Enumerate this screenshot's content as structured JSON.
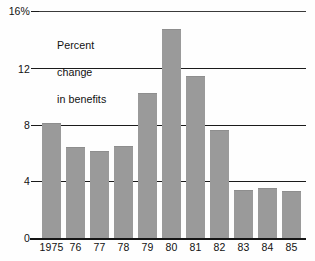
{
  "chart_data": {
    "type": "bar",
    "title": "",
    "annotation": "Percent\nchange\nin benefits",
    "xlabel": "",
    "ylabel": "",
    "categories": [
      "1975",
      "76",
      "77",
      "78",
      "79",
      "80",
      "81",
      "82",
      "83",
      "84",
      "85"
    ],
    "values": [
      8.1,
      6.4,
      6.1,
      6.5,
      10.2,
      14.7,
      11.4,
      7.6,
      3.4,
      3.5,
      3.3
    ],
    "ylim": [
      0,
      16
    ],
    "yticks": [
      0,
      4,
      8,
      12,
      16
    ],
    "ytick_labels": [
      "0",
      "4",
      "8",
      "12",
      "16%"
    ],
    "grid": true,
    "legend": false,
    "bar_color": "#9a9a9a",
    "axis_color": "#161616",
    "text_color": "#111111",
    "background": "#ffffff"
  },
  "axis": {
    "y_labels": [
      {
        "text": "16%",
        "value": 16
      },
      {
        "text": "12",
        "value": 12
      },
      {
        "text": "8",
        "value": 8
      },
      {
        "text": "4",
        "value": 4
      },
      {
        "text": "0",
        "value": 0
      }
    ],
    "x_labels": [
      "1975",
      "76",
      "77",
      "78",
      "79",
      "80",
      "81",
      "82",
      "83",
      "84",
      "85"
    ]
  },
  "annotation": {
    "line1": "Percent",
    "line2": "change",
    "line3": "in benefits"
  }
}
